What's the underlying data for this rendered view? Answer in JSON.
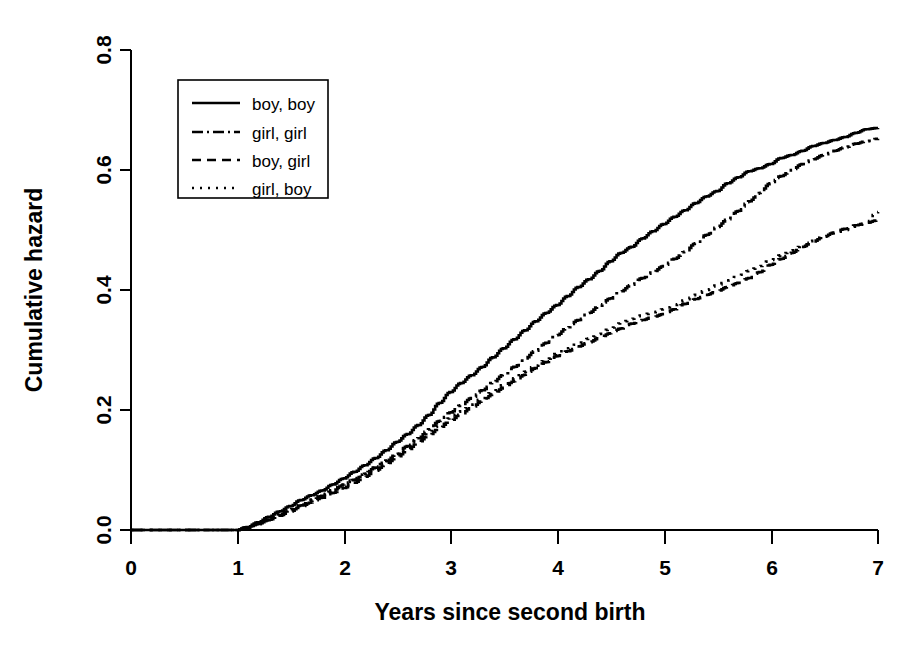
{
  "chart_data": {
    "type": "line",
    "title": "",
    "xlabel": "Years since second birth",
    "ylabel": "Cumulative hazard",
    "xlim": [
      0,
      7
    ],
    "ylim": [
      0.0,
      0.8
    ],
    "xticks": [
      "0",
      "1",
      "2",
      "3",
      "4",
      "5",
      "6",
      "7"
    ],
    "xtick_values": [
      0,
      1,
      2,
      3,
      4,
      5,
      6,
      7
    ],
    "yticks": [
      "0.0",
      "0.2",
      "0.4",
      "0.6",
      "0.8"
    ],
    "ytick_values": [
      0.0,
      0.2,
      0.4,
      0.6,
      0.8
    ],
    "grid": false,
    "legend_position": "top-left-inside",
    "curve_style": "step",
    "series": [
      {
        "name": "boy, boy",
        "style": "solid",
        "dasharray": "",
        "x": [
          0.0,
          0.5,
          1.0,
          1.1,
          1.2,
          1.3,
          1.4,
          1.5,
          1.6,
          1.7,
          1.8,
          1.9,
          2.0,
          2.1,
          2.2,
          2.3,
          2.4,
          2.5,
          2.6,
          2.7,
          2.8,
          2.9,
          3.0,
          3.1,
          3.2,
          3.3,
          3.4,
          3.5,
          3.6,
          3.7,
          3.8,
          3.9,
          4.0,
          4.1,
          4.2,
          4.3,
          4.4,
          4.5,
          4.6,
          4.7,
          4.8,
          4.9,
          5.0,
          5.1,
          5.2,
          5.3,
          5.4,
          5.5,
          5.6,
          5.7,
          5.8,
          5.9,
          6.0,
          6.1,
          6.2,
          6.3,
          6.4,
          6.5,
          6.6,
          6.7,
          6.8,
          6.9,
          7.0
        ],
        "y": [
          0.0,
          0.0,
          0.0,
          0.005,
          0.013,
          0.022,
          0.031,
          0.04,
          0.05,
          0.058,
          0.066,
          0.076,
          0.086,
          0.097,
          0.108,
          0.12,
          0.133,
          0.147,
          0.16,
          0.175,
          0.192,
          0.212,
          0.23,
          0.245,
          0.258,
          0.272,
          0.288,
          0.303,
          0.318,
          0.333,
          0.348,
          0.362,
          0.375,
          0.39,
          0.405,
          0.418,
          0.432,
          0.448,
          0.462,
          0.472,
          0.486,
          0.498,
          0.51,
          0.522,
          0.533,
          0.545,
          0.556,
          0.565,
          0.578,
          0.588,
          0.598,
          0.603,
          0.61,
          0.62,
          0.625,
          0.632,
          0.64,
          0.645,
          0.65,
          0.655,
          0.662,
          0.668,
          0.67
        ]
      },
      {
        "name": "girl, girl",
        "style": "dashdot",
        "dasharray": "14,5,3,5",
        "x": [
          0.0,
          0.5,
          1.0,
          1.1,
          1.2,
          1.3,
          1.4,
          1.5,
          1.6,
          1.7,
          1.8,
          1.9,
          2.0,
          2.1,
          2.2,
          2.3,
          2.4,
          2.5,
          2.6,
          2.7,
          2.8,
          2.9,
          3.0,
          3.1,
          3.2,
          3.3,
          3.4,
          3.5,
          3.6,
          3.7,
          3.8,
          3.9,
          4.0,
          4.1,
          4.2,
          4.3,
          4.4,
          4.5,
          4.6,
          4.7,
          4.8,
          4.9,
          5.0,
          5.1,
          5.2,
          5.3,
          5.4,
          5.5,
          5.6,
          5.7,
          5.8,
          5.9,
          6.0,
          6.1,
          6.2,
          6.3,
          6.4,
          6.5,
          6.6,
          6.7,
          6.8,
          6.9,
          7.0
        ],
        "y": [
          0.0,
          0.0,
          0.0,
          0.004,
          0.01,
          0.017,
          0.025,
          0.033,
          0.041,
          0.049,
          0.057,
          0.066,
          0.075,
          0.084,
          0.094,
          0.104,
          0.115,
          0.127,
          0.14,
          0.153,
          0.168,
          0.182,
          0.196,
          0.208,
          0.22,
          0.233,
          0.246,
          0.259,
          0.272,
          0.286,
          0.299,
          0.312,
          0.325,
          0.338,
          0.35,
          0.362,
          0.374,
          0.386,
          0.398,
          0.409,
          0.42,
          0.43,
          0.44,
          0.452,
          0.464,
          0.478,
          0.492,
          0.505,
          0.518,
          0.532,
          0.548,
          0.562,
          0.578,
          0.59,
          0.6,
          0.61,
          0.618,
          0.625,
          0.632,
          0.638,
          0.644,
          0.648,
          0.652
        ]
      },
      {
        "name": "boy, girl",
        "style": "dashed",
        "dasharray": "11,7",
        "x": [
          0.0,
          0.5,
          1.0,
          1.1,
          1.2,
          1.3,
          1.4,
          1.5,
          1.6,
          1.7,
          1.8,
          1.9,
          2.0,
          2.1,
          2.2,
          2.3,
          2.4,
          2.5,
          2.6,
          2.7,
          2.8,
          2.9,
          3.0,
          3.1,
          3.2,
          3.3,
          3.4,
          3.5,
          3.6,
          3.7,
          3.8,
          3.9,
          4.0,
          4.1,
          4.2,
          4.3,
          4.4,
          4.5,
          4.6,
          4.7,
          4.8,
          4.9,
          5.0,
          5.1,
          5.2,
          5.3,
          5.4,
          5.5,
          5.6,
          5.7,
          5.8,
          5.9,
          6.0,
          6.1,
          6.2,
          6.3,
          6.4,
          6.5,
          6.6,
          6.7,
          6.8,
          6.9,
          7.0
        ],
        "y": [
          0.0,
          0.0,
          0.0,
          0.004,
          0.01,
          0.017,
          0.024,
          0.031,
          0.039,
          0.046,
          0.054,
          0.062,
          0.07,
          0.079,
          0.089,
          0.099,
          0.11,
          0.121,
          0.133,
          0.146,
          0.158,
          0.17,
          0.182,
          0.193,
          0.204,
          0.215,
          0.226,
          0.237,
          0.248,
          0.259,
          0.27,
          0.28,
          0.29,
          0.298,
          0.306,
          0.313,
          0.32,
          0.328,
          0.336,
          0.344,
          0.35,
          0.355,
          0.36,
          0.368,
          0.377,
          0.385,
          0.392,
          0.398,
          0.405,
          0.412,
          0.42,
          0.43,
          0.442,
          0.452,
          0.462,
          0.472,
          0.481,
          0.489,
          0.496,
          0.502,
          0.508,
          0.512,
          0.516
        ]
      },
      {
        "name": "girl, boy",
        "style": "dotted",
        "dasharray": "2.5,7",
        "x": [
          0.0,
          0.5,
          1.0,
          1.1,
          1.2,
          1.3,
          1.4,
          1.5,
          1.6,
          1.7,
          1.8,
          1.9,
          2.0,
          2.1,
          2.2,
          2.3,
          2.4,
          2.5,
          2.6,
          2.7,
          2.8,
          2.9,
          3.0,
          3.1,
          3.2,
          3.3,
          3.4,
          3.5,
          3.6,
          3.7,
          3.8,
          3.9,
          4.0,
          4.1,
          4.2,
          4.3,
          4.4,
          4.5,
          4.6,
          4.7,
          4.8,
          4.9,
          5.0,
          5.1,
          5.2,
          5.3,
          5.4,
          5.5,
          5.6,
          5.7,
          5.8,
          5.9,
          6.0,
          6.1,
          6.2,
          6.3,
          6.4,
          6.5,
          6.6,
          6.7,
          6.8,
          6.9,
          7.0
        ],
        "y": [
          0.0,
          0.0,
          0.0,
          0.005,
          0.012,
          0.019,
          0.027,
          0.035,
          0.043,
          0.051,
          0.059,
          0.067,
          0.076,
          0.085,
          0.095,
          0.105,
          0.116,
          0.127,
          0.139,
          0.151,
          0.163,
          0.175,
          0.187,
          0.198,
          0.209,
          0.22,
          0.231,
          0.242,
          0.253,
          0.264,
          0.274,
          0.284,
          0.294,
          0.303,
          0.311,
          0.319,
          0.327,
          0.336,
          0.345,
          0.352,
          0.358,
          0.363,
          0.368,
          0.375,
          0.383,
          0.392,
          0.4,
          0.408,
          0.416,
          0.424,
          0.432,
          0.44,
          0.45,
          0.458,
          0.466,
          0.474,
          0.482,
          0.489,
          0.495,
          0.5,
          0.506,
          0.512,
          0.53
        ]
      }
    ]
  },
  "legend": {
    "items": [
      {
        "label": "boy, boy",
        "style": "solid"
      },
      {
        "label": "girl, girl",
        "style": "dashdot"
      },
      {
        "label": "boy, girl",
        "style": "dashed"
      },
      {
        "label": "girl, boy",
        "style": "dotted"
      }
    ]
  },
  "colors": {
    "ink": "#000000",
    "paper": "#ffffff"
  }
}
